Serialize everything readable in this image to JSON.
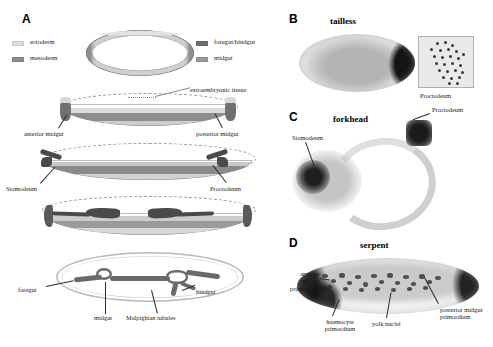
{
  "panels": {
    "A": {
      "letter": "A",
      "legend": {
        "left": [
          {
            "label": "ectoderm",
            "color": "#d9d9d9"
          },
          {
            "label": "mesoderm",
            "color": "#8c8c8c"
          }
        ],
        "right": [
          {
            "label": "foregut/hindgut",
            "color": "#6f6f6f"
          },
          {
            "label": "midgut",
            "color": "#999999"
          }
        ]
      },
      "annotations": [
        {
          "name": "extraembryonic-tissue",
          "text": "extraembryonic tissue"
        },
        {
          "name": "anterior-midgut",
          "text": "anterior midgut"
        },
        {
          "name": "posterior-midgut",
          "text": "posterior midgut"
        },
        {
          "name": "stomodeum",
          "text": "Stomodeum"
        },
        {
          "name": "proctodeum",
          "text": "Proctodeum"
        },
        {
          "name": "foregut",
          "text": "foregut"
        },
        {
          "name": "hindgut",
          "text": "hindgut"
        },
        {
          "name": "midgut",
          "text": "midgut"
        },
        {
          "name": "malpighian-tubules",
          "text": "Malpighian tubules"
        }
      ]
    },
    "B": {
      "letter": "B",
      "gene": "tailless",
      "inset_label": "Proctodeum"
    },
    "C": {
      "letter": "C",
      "gene": "forkhead",
      "annotations": [
        {
          "name": "stomodeum",
          "text": "Stomodeum"
        },
        {
          "name": "proctodeum",
          "text": "Proctodeum"
        }
      ]
    },
    "D": {
      "letter": "D",
      "gene": "serpent",
      "annotations": [
        {
          "name": "anterior-midgut-primordium",
          "text": "anterior\nmidgut\nprimordium"
        },
        {
          "name": "haemocyte-primordium",
          "text": "haemocyte\nprimordium"
        },
        {
          "name": "yolk-nuclei",
          "text": "yolk nuclei"
        },
        {
          "name": "posterior-midgut-primordium",
          "text": "posterior\nmidgut\nprimordium"
        }
      ]
    }
  }
}
